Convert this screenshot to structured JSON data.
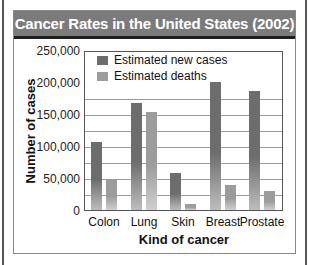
{
  "chart_data": {
    "type": "bar",
    "title": "Cancer Rates in the United States (2002)",
    "xlabel": "Kind of cancer",
    "ylabel": "Number of cases",
    "categories": [
      "Colon",
      "Lung",
      "Skin",
      "Breast",
      "Prostate"
    ],
    "series": [
      {
        "name": "Estimated new cases",
        "color": "#6d6d6d",
        "values": [
          107000,
          169000,
          58000,
          203000,
          189000
        ]
      },
      {
        "name": "Estimated deaths",
        "color": "#9c9c9c",
        "values": [
          48000,
          155000,
          10000,
          40000,
          30000
        ]
      }
    ],
    "yticks": [
      "250,000",
      "200,000",
      "150,000",
      "100,000",
      "50,000",
      "0"
    ],
    "ylim": [
      0,
      250000
    ],
    "grid": true,
    "legend_position": "top-inside"
  },
  "colors": {
    "title_bar": "#7b7b7b",
    "title_text": "#ffffff",
    "new_cases": "#6d6d6d",
    "deaths": "#9c9c9c"
  }
}
